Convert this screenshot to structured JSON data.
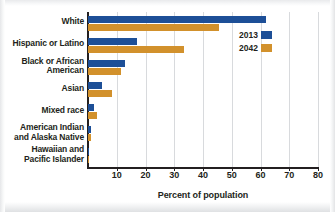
{
  "chart_data": {
    "type": "bar",
    "orientation": "horizontal",
    "title": "",
    "xlabel": "Percent of population",
    "ylabel": "",
    "xlim": [
      0,
      80
    ],
    "xticks": [
      10,
      20,
      30,
      40,
      50,
      60,
      70,
      80
    ],
    "grid": true,
    "legend_position": "right",
    "categories": [
      "White",
      "Hispanic or Latino",
      "Black or African American",
      "Asian",
      "Mixed race",
      "American Indian and Alaska Native",
      "Hawaiian and Pacific Islander"
    ],
    "category_lines": [
      [
        "White"
      ],
      [
        "Hispanic or Latino"
      ],
      [
        "Black or African",
        "American"
      ],
      [
        "Asian"
      ],
      [
        "Mixed race"
      ],
      [
        "American Indian",
        "and Alaska Native"
      ],
      [
        "Hawaiian and",
        "Pacific Islander"
      ]
    ],
    "series": [
      {
        "name": "2013",
        "color": "#1d4f97",
        "values": [
          62.0,
          17.0,
          13.0,
          5.0,
          2.0,
          1.0,
          0.3
        ]
      },
      {
        "name": "2042",
        "color": "#d2912c",
        "values": [
          45.5,
          33.5,
          11.5,
          8.5,
          3.2,
          0.9,
          0.4
        ]
      }
    ]
  },
  "axis": {
    "x_title": "Percent of population",
    "tick_labels": [
      "10",
      "20",
      "30",
      "40",
      "50",
      "60",
      "70",
      "80"
    ]
  },
  "legend": {
    "entries": [
      {
        "label": "2013",
        "color": "#1d4f97"
      },
      {
        "label": "2042",
        "color": "#d2912c"
      }
    ]
  },
  "colors": {
    "series_2013": "#1d4f97",
    "series_2042": "#d2912c",
    "axis": "#231f20",
    "gridline": "#d8dadd",
    "background": "#ffffff"
  }
}
